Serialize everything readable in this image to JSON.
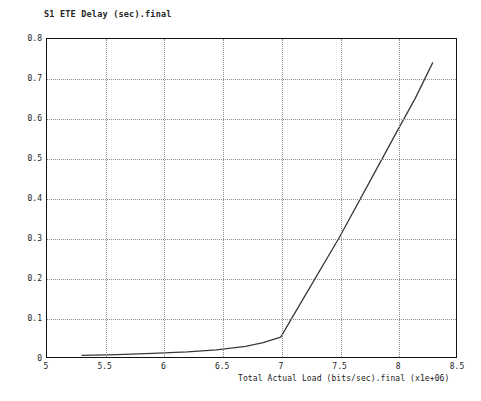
{
  "chart_data": {
    "type": "line",
    "title": "S1 ETE Delay (sec).final",
    "xlabel": "Total Actual Load (bits/sec).final (x1e+06)",
    "ylabel": "",
    "xlim": [
      5,
      8.5
    ],
    "ylim": [
      0,
      0.8
    ],
    "grid": true,
    "legend": null,
    "xticks": [
      5,
      5.5,
      6,
      6.5,
      7,
      7.5,
      8,
      8.5
    ],
    "xtick_labels": [
      "5",
      "5.5",
      "6",
      "6.5",
      "7",
      "7.5",
      "8",
      "8.5"
    ],
    "yticks": [
      0,
      0.1,
      0.2,
      0.3,
      0.4,
      0.5,
      0.6,
      0.7,
      0.8
    ],
    "ytick_labels": [
      "0",
      "0.1",
      "0.2",
      "0.3",
      "0.4",
      "0.5",
      "0.6",
      "0.7",
      "0.8"
    ],
    "line_color": "#3a3a3a",
    "series": [
      {
        "name": "S1 ETE Delay (sec).final",
        "x": [
          5.3,
          5.6,
          5.9,
          6.2,
          6.45,
          6.7,
          6.85,
          7.0,
          7.25,
          7.5,
          7.75,
          8.0,
          8.15,
          8.3
        ],
        "y": [
          0.004,
          0.006,
          0.009,
          0.013,
          0.018,
          0.027,
          0.036,
          0.05,
          0.175,
          0.3,
          0.435,
          0.57,
          0.65,
          0.74
        ]
      }
    ]
  },
  "figure": {
    "background_color": "#ffffff",
    "frame_color": "#111111",
    "grid_color": "#8d8d8d"
  }
}
